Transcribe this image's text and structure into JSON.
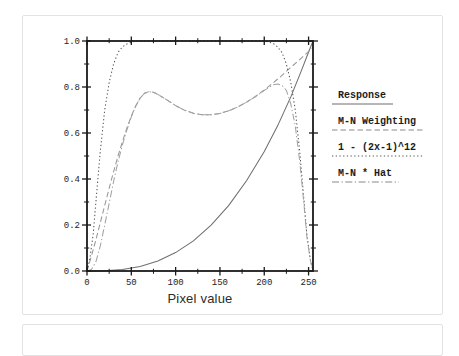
{
  "figure": {
    "x_axis_title": "Pixel value"
  },
  "chart_data": {
    "type": "line",
    "title": "",
    "xlabel": "Pixel value",
    "ylabel": "",
    "xlim": [
      0,
      255
    ],
    "ylim": [
      0.0,
      1.0
    ],
    "grid": false,
    "legend_position": "right-outside",
    "axis_color": "#1a1a1a",
    "x_ticks": {
      "major": [
        0,
        50,
        100,
        150,
        200,
        250
      ],
      "labels": [
        "0",
        "50",
        "100",
        "150",
        "200",
        "250"
      ],
      "minor": [
        25,
        75,
        125,
        175,
        225
      ]
    },
    "y_ticks": {
      "major": [
        0.0,
        0.2,
        0.4,
        0.6,
        0.8,
        1.0
      ],
      "labels": [
        "0.0",
        "0.2",
        "0.4",
        "0.6",
        "0.8",
        "1.0"
      ],
      "minor": [
        0.1,
        0.3,
        0.5,
        0.7,
        0.9
      ]
    },
    "series": [
      {
        "name": "Response",
        "style": "solid",
        "color": "#6f6f6f",
        "points": [
          [
            0,
            0
          ],
          [
            10,
            0.0002
          ],
          [
            20,
            0.001
          ],
          [
            40,
            0.007
          ],
          [
            60,
            0.02
          ],
          [
            80,
            0.044
          ],
          [
            100,
            0.08
          ],
          [
            120,
            0.131
          ],
          [
            140,
            0.199
          ],
          [
            160,
            0.285
          ],
          [
            180,
            0.392
          ],
          [
            200,
            0.52
          ],
          [
            215,
            0.63
          ],
          [
            230,
            0.757
          ],
          [
            242,
            0.872
          ],
          [
            250,
            0.952
          ],
          [
            255,
            1.0
          ]
        ]
      },
      {
        "name": "M-N Weighting",
        "style": "dashed",
        "color": "#989898",
        "points": [
          [
            0,
            0
          ],
          [
            5,
            0.065
          ],
          [
            10,
            0.135
          ],
          [
            15,
            0.21
          ],
          [
            20,
            0.285
          ],
          [
            25,
            0.36
          ],
          [
            30,
            0.432
          ],
          [
            35,
            0.5
          ],
          [
            40,
            0.563
          ],
          [
            45,
            0.622
          ],
          [
            50,
            0.673
          ],
          [
            55,
            0.717
          ],
          [
            60,
            0.752
          ],
          [
            65,
            0.773
          ],
          [
            70,
            0.78
          ],
          [
            75,
            0.777
          ],
          [
            80,
            0.768
          ],
          [
            90,
            0.744
          ],
          [
            100,
            0.719
          ],
          [
            110,
            0.699
          ],
          [
            120,
            0.686
          ],
          [
            130,
            0.679
          ],
          [
            140,
            0.679
          ],
          [
            150,
            0.685
          ],
          [
            160,
            0.697
          ],
          [
            170,
            0.713
          ],
          [
            180,
            0.734
          ],
          [
            190,
            0.759
          ],
          [
            200,
            0.787
          ],
          [
            210,
            0.818
          ],
          [
            220,
            0.851
          ],
          [
            230,
            0.885
          ],
          [
            240,
            0.919
          ],
          [
            248,
            0.947
          ],
          [
            255,
            0.972
          ]
        ]
      },
      {
        "name": "1 - (2x-1)^12",
        "style": "dotted",
        "color": "#555555",
        "points": [
          [
            0,
            0
          ],
          [
            3,
            0.05
          ],
          [
            7,
            0.16
          ],
          [
            10,
            0.3
          ],
          [
            15,
            0.52
          ],
          [
            20,
            0.7
          ],
          [
            25,
            0.82
          ],
          [
            30,
            0.9
          ],
          [
            35,
            0.95
          ],
          [
            40,
            0.975
          ],
          [
            45,
            0.987
          ],
          [
            50,
            0.995
          ],
          [
            55,
            1.0
          ],
          [
            200,
            1.0
          ],
          [
            210,
            0.99
          ],
          [
            215,
            0.975
          ],
          [
            220,
            0.95
          ],
          [
            225,
            0.9
          ],
          [
            230,
            0.82
          ],
          [
            235,
            0.7
          ],
          [
            240,
            0.52
          ],
          [
            245,
            0.3
          ],
          [
            248,
            0.16
          ],
          [
            252,
            0.05
          ],
          [
            255,
            0
          ]
        ]
      },
      {
        "name": "M-N * Hat",
        "style": "dashdot",
        "color": "#a2a2a2",
        "points": [
          [
            0,
            0
          ],
          [
            5,
            0.006
          ],
          [
            10,
            0.04
          ],
          [
            15,
            0.109
          ],
          [
            20,
            0.2
          ],
          [
            25,
            0.295
          ],
          [
            30,
            0.389
          ],
          [
            35,
            0.475
          ],
          [
            40,
            0.549
          ],
          [
            45,
            0.614
          ],
          [
            50,
            0.67
          ],
          [
            55,
            0.717
          ],
          [
            60,
            0.752
          ],
          [
            65,
            0.773
          ],
          [
            70,
            0.78
          ],
          [
            75,
            0.777
          ],
          [
            80,
            0.768
          ],
          [
            90,
            0.744
          ],
          [
            100,
            0.719
          ],
          [
            110,
            0.699
          ],
          [
            120,
            0.686
          ],
          [
            130,
            0.679
          ],
          [
            140,
            0.679
          ],
          [
            150,
            0.685
          ],
          [
            160,
            0.697
          ],
          [
            170,
            0.713
          ],
          [
            180,
            0.734
          ],
          [
            190,
            0.758
          ],
          [
            200,
            0.785
          ],
          [
            205,
            0.797
          ],
          [
            210,
            0.81
          ],
          [
            215,
            0.813
          ],
          [
            220,
            0.808
          ],
          [
            225,
            0.785
          ],
          [
            230,
            0.726
          ],
          [
            235,
            0.63
          ],
          [
            240,
            0.478
          ],
          [
            245,
            0.284
          ],
          [
            248,
            0.152
          ],
          [
            252,
            0.048
          ],
          [
            255,
            0
          ]
        ]
      }
    ]
  }
}
